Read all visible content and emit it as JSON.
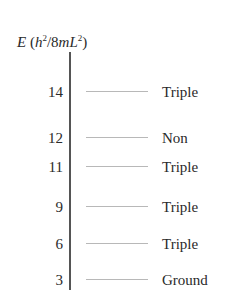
{
  "chart_data": {
    "type": "energy-level-diagram",
    "axis_title": {
      "symbol": "E",
      "unit_prefix": "(h",
      "unit_exp1": "2",
      "unit_mid": "/8mL",
      "unit_exp2": "2",
      "unit_suffix": ")"
    },
    "levels": [
      {
        "energy": "14",
        "label": "Triple",
        "y": 82
      },
      {
        "energy": "12",
        "label": "Non",
        "y": 128
      },
      {
        "energy": "11",
        "label": "Triple",
        "y": 157
      },
      {
        "energy": "9",
        "label": "Triple",
        "y": 197
      },
      {
        "energy": "6",
        "label": "Triple",
        "y": 234
      },
      {
        "energy": "3",
        "label": "Ground",
        "y": 270
      }
    ]
  }
}
